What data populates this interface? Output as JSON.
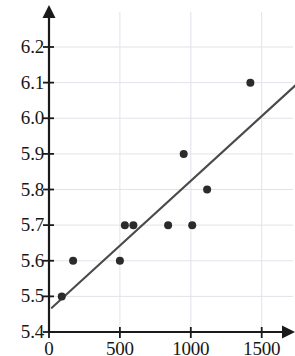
{
  "chart_data": {
    "type": "scatter",
    "title": "",
    "xlabel": "",
    "ylabel": "",
    "xlim": [
      0,
      1560
    ],
    "ylim": [
      5.4,
      6.26
    ],
    "xticks": [
      0,
      500,
      1000,
      1500
    ],
    "xtick_labels": [
      "0",
      "500",
      "1000",
      "1500"
    ],
    "yticks": [
      5.4,
      5.5,
      5.6,
      5.7,
      5.8,
      5.9,
      6.0,
      6.1,
      6.2
    ],
    "ytick_labels": [
      "5.4",
      "5.5",
      "5.6",
      "5.7",
      "5.8",
      "5.9",
      "6.0",
      "6.1",
      "6.2"
    ],
    "grid": true,
    "grid_color": "#e2e2ea",
    "legend": null,
    "point_color": "#2b2b2b",
    "point_radius": 4,
    "line_color": "#4a4a4a",
    "axis_color": "#1a1a1a",
    "points": [
      {
        "x": 90,
        "y": 5.5
      },
      {
        "x": 170,
        "y": 5.6
      },
      {
        "x": 500,
        "y": 5.6
      },
      {
        "x": 535,
        "y": 5.7
      },
      {
        "x": 595,
        "y": 5.7
      },
      {
        "x": 840,
        "y": 5.7
      },
      {
        "x": 1010,
        "y": 5.7
      },
      {
        "x": 950,
        "y": 5.9
      },
      {
        "x": 1115,
        "y": 5.8
      },
      {
        "x": 1420,
        "y": 6.1
      }
    ],
    "trendline": {
      "x0": 20,
      "y0": 5.468,
      "x1": 1745,
      "y1": 6.095
    }
  }
}
